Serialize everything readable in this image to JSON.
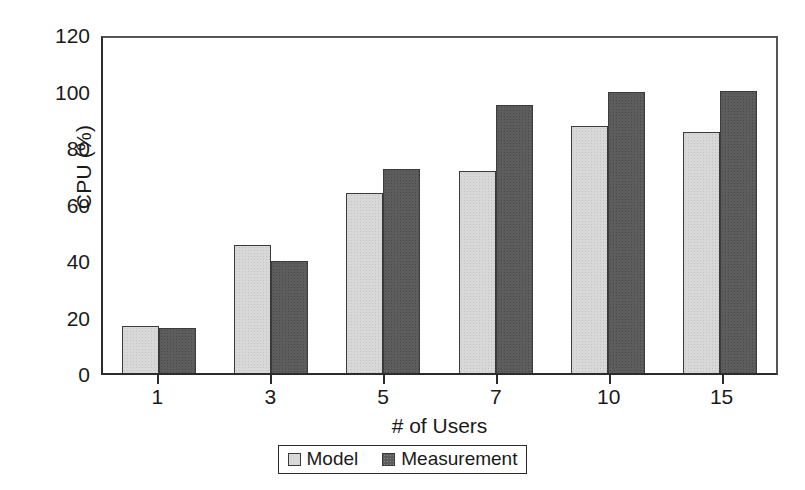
{
  "chart_data": {
    "type": "bar",
    "title": "",
    "xlabel": "# of Users",
    "ylabel": "CPU (%)",
    "categories": [
      "1",
      "3",
      "5",
      "7",
      "10",
      "15"
    ],
    "series": [
      {
        "name": "Model",
        "color": "#d8d8d8",
        "values": [
          17,
          46,
          64.5,
          72.5,
          88.5,
          86.5
        ]
      },
      {
        "name": "Measurement",
        "color": "#5d5d5d",
        "values": [
          16,
          40,
          73,
          96,
          100.5,
          101
        ]
      }
    ],
    "ylim": [
      0,
      120
    ],
    "yticks": [
      0,
      20,
      40,
      60,
      80,
      100,
      120
    ],
    "ytick_labels": [
      "0",
      "20",
      "40",
      "60",
      "80",
      "100",
      "120"
    ],
    "grid": false,
    "legend_position": "bottom-center",
    "legend_entries": [
      "Model",
      "Measurement"
    ],
    "plot_frame": true
  }
}
